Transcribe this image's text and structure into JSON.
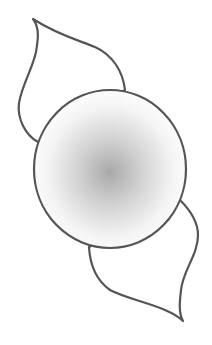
{
  "drawing": {
    "subject": "circle-with-two-leaves",
    "stroke_color": "#555555",
    "fill_color": "#ffffff",
    "gradient_center": "#a8a8a8",
    "gradient_edge": "#ffffff"
  }
}
